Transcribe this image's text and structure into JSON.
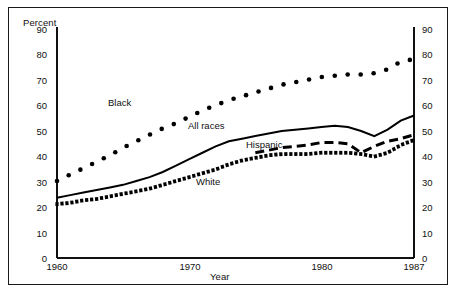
{
  "figure": {
    "y_axis_title": "Percent",
    "x_axis_title": "Year"
  },
  "axes": {
    "y_ticks": [
      "0",
      "10",
      "20",
      "30",
      "40",
      "50",
      "60",
      "70",
      "80",
      "90"
    ],
    "x_ticks": [
      "1960",
      "1970",
      "1980",
      "1987"
    ]
  },
  "series_labels": {
    "black": "Black",
    "all_races": "All races",
    "hispanic": "Hispanic",
    "white": "White"
  },
  "chart_data": {
    "type": "line",
    "title": "",
    "subtitle": "",
    "xlabel": "Year",
    "ylabel": "Percent",
    "xlim": [
      1960,
      1987
    ],
    "ylim": [
      0,
      90
    ],
    "grid": false,
    "legend_position": "inline-annotations",
    "xticks": [
      1960,
      1970,
      1980,
      1987
    ],
    "yticks": [
      0,
      10,
      20,
      30,
      40,
      50,
      60,
      70,
      80,
      90
    ],
    "x": [
      1960,
      1961,
      1962,
      1963,
      1964,
      1965,
      1966,
      1967,
      1968,
      1969,
      1970,
      1971,
      1972,
      1973,
      1974,
      1975,
      1976,
      1977,
      1978,
      1979,
      1980,
      1981,
      1982,
      1983,
      1984,
      1985,
      1986,
      1987
    ],
    "series": [
      {
        "name": "Black",
        "style": "dotted",
        "color": "#000000",
        "values": [
          30.0,
          32.5,
          35.0,
          37.5,
          40.0,
          43.0,
          45.5,
          48.0,
          50.5,
          52.5,
          55.0,
          57.5,
          59.5,
          61.5,
          63.0,
          64.5,
          66.0,
          67.5,
          68.5,
          69.5,
          70.5,
          71.0,
          71.5,
          71.5,
          72.0,
          73.5,
          76.5,
          77.5
        ]
      },
      {
        "name": "All races",
        "style": "solid",
        "color": "#000000",
        "values": [
          23.5,
          24.5,
          25.5,
          26.5,
          27.5,
          28.5,
          30.0,
          31.5,
          33.5,
          36.0,
          38.5,
          41.0,
          43.5,
          45.5,
          46.5,
          47.5,
          48.5,
          49.5,
          50.0,
          50.5,
          51.0,
          51.5,
          51.0,
          49.5,
          47.5,
          50.0,
          53.5,
          55.5
        ]
      },
      {
        "name": "Hispanic",
        "style": "dashed",
        "color": "#000000",
        "values": [
          null,
          null,
          null,
          null,
          null,
          null,
          null,
          null,
          null,
          null,
          null,
          null,
          null,
          null,
          null,
          41.0,
          42.0,
          43.0,
          43.5,
          44.0,
          45.0,
          45.0,
          44.5,
          41.0,
          43.5,
          45.5,
          46.5,
          48.0
        ]
      },
      {
        "name": "White",
        "style": "heavy-dotted",
        "color": "#000000",
        "values": [
          21.0,
          21.5,
          22.5,
          23.0,
          24.0,
          25.0,
          26.0,
          27.0,
          28.5,
          30.0,
          31.5,
          33.0,
          34.5,
          36.5,
          38.0,
          39.0,
          40.0,
          40.5,
          40.5,
          40.5,
          41.0,
          41.0,
          41.0,
          40.5,
          39.5,
          41.0,
          44.0,
          46.0
        ]
      }
    ]
  }
}
